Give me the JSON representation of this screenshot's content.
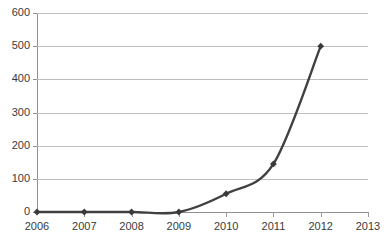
{
  "chart_data": {
    "type": "line",
    "title": "",
    "title_note": "title row is cropped off the top edge of the screenshot and is illegible",
    "xlabel": "",
    "ylabel": "",
    "categories": [
      "2006",
      "2007",
      "2008",
      "2009",
      "2010",
      "2011",
      "2012",
      "2013"
    ],
    "series": [
      {
        "name": "series-1",
        "values": [
          0,
          0,
          0,
          0,
          55,
          145,
          500,
          null
        ]
      }
    ],
    "ylim": [
      0,
      600
    ],
    "ytick_values": [
      0,
      100,
      200,
      300,
      400,
      500,
      600
    ],
    "ytick_labels": [
      "0",
      "100",
      "200",
      "300",
      "400",
      "500",
      "600"
    ],
    "grid": true,
    "grid_axis": "y",
    "legend": false,
    "legend_position": "none",
    "marker": "diamond",
    "colors": {
      "line": "#404040",
      "marker": "#3a3a3a",
      "gridline": "#bfbfbf",
      "axis": "#8f8f8f",
      "text": "#3a3a3a",
      "background": "#ffffff"
    }
  }
}
